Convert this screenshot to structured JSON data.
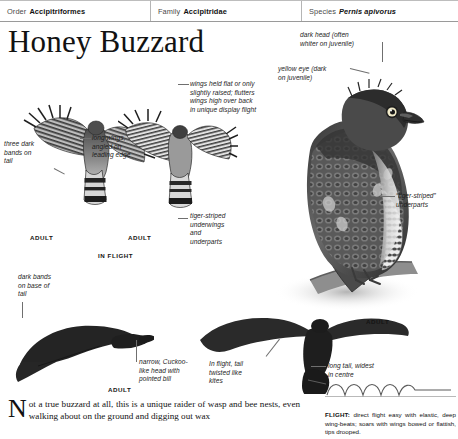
{
  "header": {
    "cells": [
      {
        "label": "Order",
        "value": "Accipitriformes",
        "italic": false
      },
      {
        "label": "Family",
        "value": "Accipitridae",
        "italic": false
      },
      {
        "label": "Species",
        "value": "Pernis apivorus",
        "italic": true
      }
    ]
  },
  "page_title": "Honey Buzzard",
  "annotations": [
    {
      "id": "three-dark-bands",
      "text": "three dark\nbands on\ntail"
    },
    {
      "id": "long-wings",
      "text": "long wings,\nangled on\nleading edge"
    },
    {
      "id": "wings-held-flat",
      "text": "wings held flat or only\nslightly raised; flutters\nwings high over back\nin unique display flight"
    },
    {
      "id": "tiger-striped-underwings",
      "text": "tiger-striped\nunderwings\nand\nunderparts"
    },
    {
      "id": "dark-head",
      "text": "dark head (often\nwhiter on juvenile)"
    },
    {
      "id": "yellow-eye",
      "text": "yellow eye (dark\non juvenile)"
    },
    {
      "id": "tiger-striped-underparts",
      "text": "“tiger-striped”\nunderparts"
    },
    {
      "id": "dark-bands-base",
      "text": "dark bands\non base of\ntail"
    },
    {
      "id": "cuckoo-head",
      "text": "narrow, Cuckoo-\nlike head with\npointed bill"
    },
    {
      "id": "tail-twisted",
      "text": "In flight, tail\ntwisted like\nkites"
    },
    {
      "id": "long-tail",
      "text": "long tail, widest\nin centre"
    }
  ],
  "captions": {
    "adult": "ADULT",
    "in_flight": "IN FLIGHT"
  },
  "body_text": {
    "dropcap": "N",
    "text": "ot a true buzzard at all, this is a unique raider of wasp and bee nests, even walking about on the ground and digging out wax"
  },
  "flight_note": {
    "label": "FLIGHT:",
    "text": " direct flight easy with elastic, deep wing-beats; soars with wings bowed or flattish, tips drooped."
  },
  "colors": {
    "ink": "#1a1a1a",
    "rule": "#b5b5b5",
    "leader": "#6f6f6f",
    "bird_dark": "#2b2b2b",
    "bird_mid": "#6d6d6d",
    "bird_light": "#c9c9c9"
  }
}
